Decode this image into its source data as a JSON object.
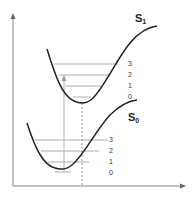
{
  "diagram": {
    "type": "potential-energy-curves",
    "colors": {
      "curve": "#222222",
      "level": "#9a9a9a",
      "axis": "#888888",
      "arrow": "#aaaaaa"
    },
    "states": [
      {
        "name": "S",
        "subscript": "1",
        "levels": [
          "3",
          "2",
          "1",
          "0"
        ]
      },
      {
        "name": "S",
        "subscript": "0",
        "levels": [
          "3",
          "2",
          "1",
          "0"
        ]
      }
    ]
  }
}
